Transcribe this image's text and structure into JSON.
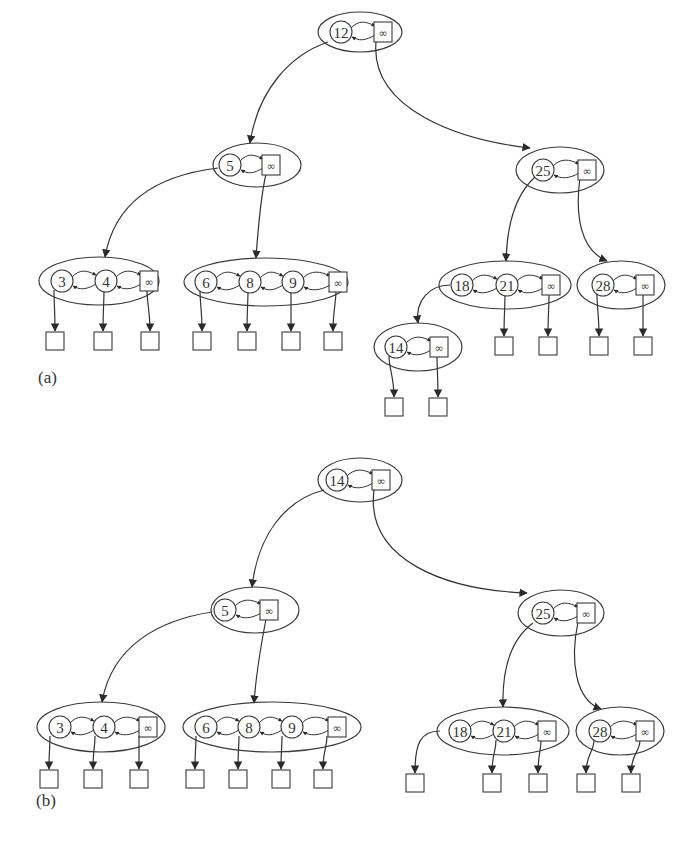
{
  "figure": {
    "type": "skip-list-style 2-3-4 tree (linked node lists with infinity sentinels)",
    "colors": {
      "stroke": "#3a3a3a",
      "background": "#ffffff"
    },
    "panels": [
      {
        "label": "(a)",
        "label_pos": [
          38,
          380
        ],
        "nodes": [
          {
            "id": "a-root",
            "keys": [
              "12"
            ],
            "cx": 360,
            "cy": 32,
            "rx": 42,
            "ry": 20,
            "key_x": [
              341
            ],
            "inf_x": 383
          },
          {
            "id": "a-5",
            "keys": [
              "5"
            ],
            "cx": 257,
            "cy": 165,
            "rx": 44,
            "ry": 22,
            "key_x": [
              230
            ],
            "inf_x": 271
          },
          {
            "id": "a-25",
            "keys": [
              "25"
            ],
            "cx": 560,
            "cy": 170,
            "rx": 44,
            "ry": 23,
            "key_x": [
              543
            ],
            "inf_x": 587
          },
          {
            "id": "a-3-4",
            "keys": [
              "3",
              "4"
            ],
            "cx": 99,
            "cy": 281,
            "rx": 60,
            "ry": 24,
            "key_x": [
              62,
              106
            ],
            "inf_x": 149
          },
          {
            "id": "a-6-8-9",
            "keys": [
              "6",
              "8",
              "9"
            ],
            "cx": 266,
            "cy": 282,
            "rx": 82,
            "ry": 24,
            "key_x": [
              206,
              250,
              293
            ],
            "inf_x": 338
          },
          {
            "id": "a-18-21",
            "keys": [
              "18",
              "21"
            ],
            "cx": 505,
            "cy": 285,
            "rx": 66,
            "ry": 24,
            "key_x": [
              462,
              507
            ],
            "inf_x": 551
          },
          {
            "id": "a-28",
            "keys": [
              "28"
            ],
            "cx": 621,
            "cy": 285,
            "rx": 44,
            "ry": 24,
            "key_x": [
              603
            ],
            "inf_x": 645
          },
          {
            "id": "a-14",
            "keys": [
              "14"
            ],
            "cx": 418,
            "cy": 347,
            "rx": 44,
            "ry": 24,
            "key_x": [
              396
            ],
            "inf_x": 439
          }
        ],
        "edges": [
          {
            "from": "a-root",
            "to": "a-5",
            "d": "M 328 42 C 290 55, 258 90, 250 143"
          },
          {
            "from": "a-root",
            "to": "a-25",
            "d": "M 376 42 C 370 110, 460 140, 530 148"
          },
          {
            "from": "a-5",
            "to": "a-3-4",
            "d": "M 218 168 C 160 175, 115 200, 105 257"
          },
          {
            "from": "a-5",
            "to": "a-6-8-9",
            "d": "M 266 174 C 260 200, 258 230, 256 258"
          },
          {
            "from": "a-25",
            "to": "a-18-21",
            "d": "M 535 177 C 515 195, 507 225, 506 261"
          },
          {
            "from": "a-25",
            "to": "a-28",
            "d": "M 580 177 C 575 215, 580 250, 607 261"
          },
          {
            "from": "a-18-21",
            "to": "a-14",
            "d": "M 450 285 C 430 285, 415 300, 418 323"
          }
        ],
        "leaves": [
          {
            "x": 46,
            "y": 332,
            "from_x": 54,
            "from_y": 290
          },
          {
            "x": 94,
            "y": 332,
            "from_x": 104,
            "from_y": 290
          },
          {
            "x": 141,
            "y": 332,
            "from_x": 147,
            "from_y": 290
          },
          {
            "x": 193,
            "y": 332,
            "from_x": 200,
            "from_y": 290
          },
          {
            "x": 238,
            "y": 332,
            "from_x": 248,
            "from_y": 290
          },
          {
            "x": 282,
            "y": 332,
            "from_x": 291,
            "from_y": 290
          },
          {
            "x": 324,
            "y": 332,
            "from_x": 336,
            "from_y": 290
          },
          {
            "x": 495,
            "y": 337,
            "from_x": 505,
            "from_y": 294
          },
          {
            "x": 539,
            "y": 337,
            "from_x": 549,
            "from_y": 294
          },
          {
            "x": 590,
            "y": 337,
            "from_x": 597,
            "from_y": 294
          },
          {
            "x": 634,
            "y": 337,
            "from_x": 643,
            "from_y": 294
          },
          {
            "x": 385,
            "y": 398,
            "from_x": 389,
            "from_y": 356
          },
          {
            "x": 429,
            "y": 398,
            "from_x": 437,
            "from_y": 356
          }
        ]
      },
      {
        "label": "(b)",
        "label_pos": [
          36,
          803
        ],
        "nodes": [
          {
            "id": "b-root",
            "keys": [
              "14"
            ],
            "cx": 360,
            "cy": 480,
            "rx": 42,
            "ry": 22,
            "key_x": [
              337
            ],
            "inf_x": 381
          },
          {
            "id": "b-5",
            "keys": [
              "5"
            ],
            "cx": 255,
            "cy": 610,
            "rx": 44,
            "ry": 23,
            "key_x": [
              225
            ],
            "inf_x": 269
          },
          {
            "id": "b-25",
            "keys": [
              "25"
            ],
            "cx": 561,
            "cy": 613,
            "rx": 43,
            "ry": 23,
            "key_x": [
              543
            ],
            "inf_x": 586
          },
          {
            "id": "b-3-4",
            "keys": [
              "3",
              "4"
            ],
            "cx": 101,
            "cy": 727,
            "rx": 64,
            "ry": 25,
            "key_x": [
              60,
              104
            ],
            "inf_x": 148
          },
          {
            "id": "b-6-8-9",
            "keys": [
              "6",
              "8",
              "9"
            ],
            "cx": 272,
            "cy": 727,
            "rx": 89,
            "ry": 25,
            "key_x": [
              206,
              249,
              292
            ],
            "inf_x": 337
          },
          {
            "id": "b-18-21",
            "keys": [
              "18",
              "21"
            ],
            "cx": 503,
            "cy": 731,
            "rx": 66,
            "ry": 24,
            "key_x": [
              460,
              504
            ],
            "inf_x": 547
          },
          {
            "id": "b-28",
            "keys": [
              "28"
            ],
            "cx": 620,
            "cy": 731,
            "rx": 44,
            "ry": 24,
            "key_x": [
              600
            ],
            "inf_x": 645
          }
        ],
        "edges": [
          {
            "from": "b-root",
            "to": "b-5",
            "d": "M 324 490 C 285 500, 258 535, 252 587"
          },
          {
            "from": "b-root",
            "to": "b-25",
            "d": "M 374 490 C 365 560, 445 590, 527 593"
          },
          {
            "from": "b-5",
            "to": "b-3-4",
            "d": "M 212 612 C 160 620, 112 645, 102 702"
          },
          {
            "from": "b-5",
            "to": "b-6-8-9",
            "d": "M 266 619 C 260 650, 256 675, 254 703"
          },
          {
            "from": "b-25",
            "to": "b-18-21",
            "d": "M 533 623 C 510 640, 502 670, 503 707"
          },
          {
            "from": "b-25",
            "to": "b-28",
            "d": "M 578 622 C 570 660, 575 700, 601 709"
          }
        ],
        "leaves": [
          {
            "x": 40,
            "y": 770,
            "from_x": 50,
            "from_y": 736
          },
          {
            "x": 84,
            "y": 770,
            "from_x": 95,
            "from_y": 736
          },
          {
            "x": 130,
            "y": 770,
            "from_x": 139,
            "from_y": 736
          },
          {
            "x": 186,
            "y": 770,
            "from_x": 196,
            "from_y": 736
          },
          {
            "x": 229,
            "y": 770,
            "from_x": 239,
            "from_y": 736
          },
          {
            "x": 272,
            "y": 770,
            "from_x": 282,
            "from_y": 736
          },
          {
            "x": 314,
            "y": 770,
            "from_x": 327,
            "from_y": 736
          },
          {
            "x": 406,
            "y": 774,
            "from_x": 440,
            "from_y": 731,
            "curved": true
          },
          {
            "x": 483,
            "y": 774,
            "from_x": 496,
            "from_y": 740
          },
          {
            "x": 529,
            "y": 774,
            "from_x": 541,
            "from_y": 740
          },
          {
            "x": 577,
            "y": 774,
            "from_x": 594,
            "from_y": 740
          },
          {
            "x": 622,
            "y": 774,
            "from_x": 640,
            "from_y": 740
          }
        ]
      }
    ],
    "inf_symbol": "∞",
    "icons": {
      "leaf": "empty-square",
      "key": "circle",
      "sentinel": "infinity-square"
    }
  }
}
